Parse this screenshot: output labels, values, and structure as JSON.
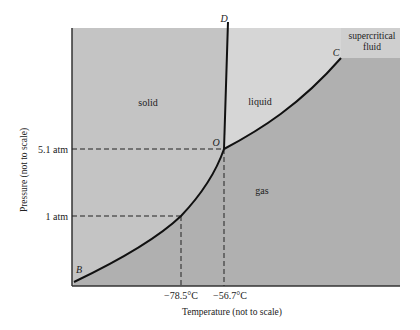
{
  "diagram": {
    "xlabel": "Temperature (not to scale)",
    "ylabel": "Pressure (not to scale)",
    "regions": {
      "solid": "solid",
      "liquid": "liquid",
      "gas": "gas",
      "supercritical": [
        "supercritical",
        "fluid"
      ]
    },
    "points": {
      "D": "D",
      "O": "O",
      "C": "C",
      "B": "B"
    },
    "y_ticks": [
      "5.1 atm",
      "1 atm"
    ],
    "x_ticks": [
      "−78.5°C",
      "−56.7°C"
    ],
    "colors": {
      "solid": "#c4c4c4",
      "liquid": "#d6d6d6",
      "gas": "#b0b0b0",
      "supercritical": "#cfcfcf",
      "curve": "#111111"
    }
  }
}
